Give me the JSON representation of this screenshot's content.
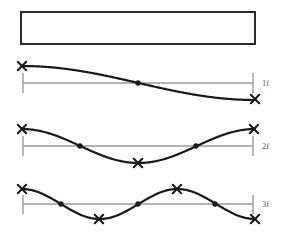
{
  "figure": {
    "title": "",
    "background_color": "#ffffff",
    "curve_color": "#1a1a1a",
    "reference_line_color": "#9a9a9a",
    "marker_color": "#1a1a1a",
    "label_color": "#555555",
    "beam": {
      "name": "undeformed-beam",
      "x": 21,
      "y": 12,
      "width": 234,
      "height": 32,
      "stroke": "#2b2b2b",
      "fill": "#ffffff",
      "stroke_width": 2
    },
    "modes": [
      {
        "label": "1f",
        "mode_number": 1,
        "half_waves": 1,
        "axis_y": 83,
        "amplitude": 17,
        "phase_deg": 0,
        "x_start": 22,
        "x_end": 255,
        "reference_line": {
          "x1": 23,
          "x2": 253,
          "y": 83
        },
        "ticks": [
          {
            "x": 23,
            "y1": 73,
            "y2": 93
          },
          {
            "x": 253,
            "y1": 73,
            "y2": 93
          }
        ],
        "antinodes": [
          {
            "x": 22,
            "y": 66
          },
          {
            "x": 255,
            "y": 99
          }
        ],
        "nodes": [
          {
            "x": 138,
            "y": 83
          }
        ]
      },
      {
        "label": "2f",
        "mode_number": 2,
        "half_waves": 2,
        "axis_y": 146,
        "amplitude": 17,
        "phase_deg": 0,
        "x_start": 22,
        "x_end": 255,
        "reference_line": {
          "x1": 23,
          "x2": 253,
          "y": 146
        },
        "ticks": [
          {
            "x": 23,
            "y1": 136,
            "y2": 156
          },
          {
            "x": 253,
            "y1": 136,
            "y2": 156
          }
        ],
        "antinodes": [
          {
            "x": 22,
            "y": 129
          },
          {
            "x": 138,
            "y": 163
          },
          {
            "x": 254,
            "y": 129
          }
        ],
        "nodes": [
          {
            "x": 80,
            "y": 146
          },
          {
            "x": 196,
            "y": 146
          }
        ]
      },
      {
        "label": "3f",
        "mode_number": 3,
        "half_waves": 3,
        "axis_y": 204,
        "amplitude": 15,
        "phase_deg": 0,
        "x_start": 22,
        "x_end": 255,
        "reference_line": {
          "x1": 23,
          "x2": 253,
          "y": 204
        },
        "ticks": [
          {
            "x": 23,
            "y1": 195,
            "y2": 214
          },
          {
            "x": 253,
            "y1": 195,
            "y2": 214
          }
        ],
        "antinodes": [
          {
            "x": 22,
            "y": 189
          },
          {
            "x": 99,
            "y": 219
          },
          {
            "x": 177,
            "y": 189
          },
          {
            "x": 255,
            "y": 219
          }
        ],
        "nodes": [
          {
            "x": 61,
            "y": 204
          },
          {
            "x": 138,
            "y": 204
          },
          {
            "x": 215,
            "y": 204
          }
        ]
      }
    ],
    "label_positions": [
      {
        "x": 262,
        "y": 86
      },
      {
        "x": 262,
        "y": 149
      },
      {
        "x": 262,
        "y": 207
      }
    ]
  },
  "chart_data": {
    "type": "line",
    "xlabel": "",
    "ylabel": "",
    "grid": false,
    "legend_position": "right",
    "series": [
      {
        "name": "1f",
        "description": "First bending mode, one half-wave, 1 node, 2 antinodes",
        "nodes_count": 1,
        "antinodes_count": 2,
        "values": [
          1,
          0.92,
          0.71,
          0.38,
          0,
          -0.38,
          -0.71,
          -0.92,
          -1
        ]
      },
      {
        "name": "2f",
        "description": "Second bending mode, two half-waves, 2 nodes, 3 antinodes",
        "nodes_count": 2,
        "antinodes_count": 3,
        "values": [
          1,
          0.71,
          0,
          -0.71,
          -1,
          -0.71,
          0,
          0.71,
          1
        ]
      },
      {
        "name": "3f",
        "description": "Third bending mode, three half-waves, 3 nodes, 4 antinodes",
        "nodes_count": 3,
        "antinodes_count": 4,
        "values": [
          1,
          0.38,
          -0.71,
          -0.92,
          0,
          0.92,
          0.71,
          -0.38,
          -1
        ]
      }
    ],
    "x": [
      0,
      0.125,
      0.25,
      0.375,
      0.5,
      0.625,
      0.75,
      0.875,
      1
    ],
    "ylim": [
      -1,
      1
    ],
    "xlim": [
      0,
      1
    ]
  }
}
